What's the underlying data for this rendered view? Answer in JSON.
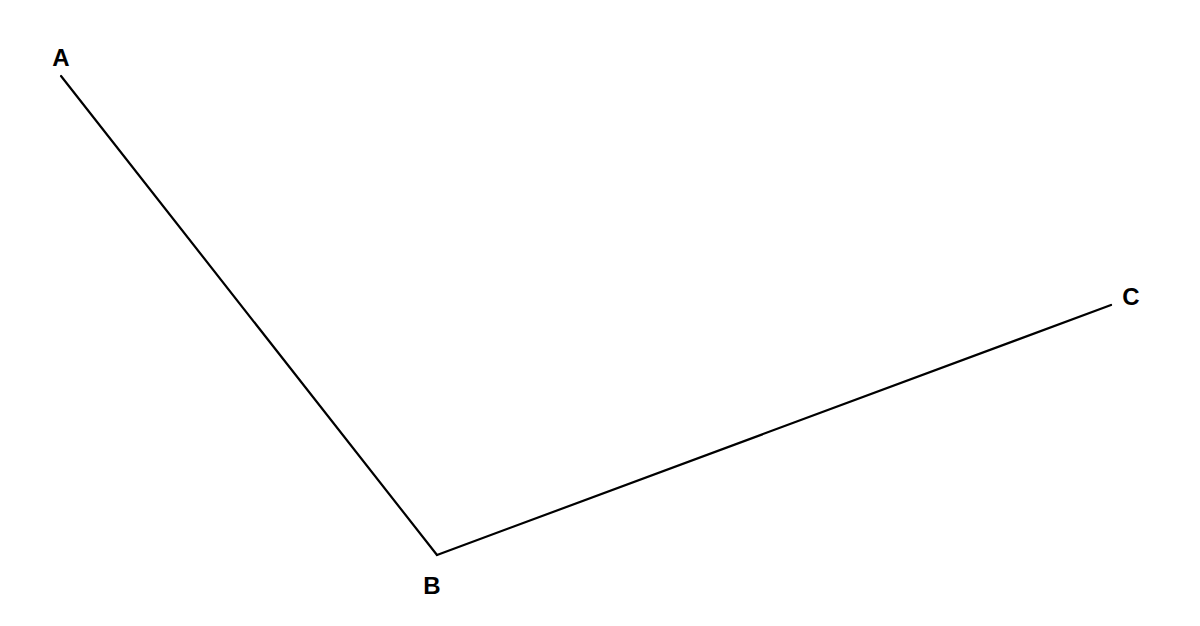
{
  "diagram": {
    "type": "angle",
    "stroke_color": "#000000",
    "background": "#ffffff",
    "points": {
      "A": {
        "label": "A",
        "x": 61,
        "y": 76,
        "label_x": 61,
        "label_y": 66
      },
      "B": {
        "label": "B",
        "x": 437,
        "y": 555,
        "label_x": 432,
        "label_y": 594
      },
      "C": {
        "label": "C",
        "x": 1111,
        "y": 305,
        "label_x": 1131,
        "label_y": 305
      }
    },
    "segments": [
      {
        "from": "A",
        "to": "B"
      },
      {
        "from": "B",
        "to": "C"
      }
    ]
  }
}
